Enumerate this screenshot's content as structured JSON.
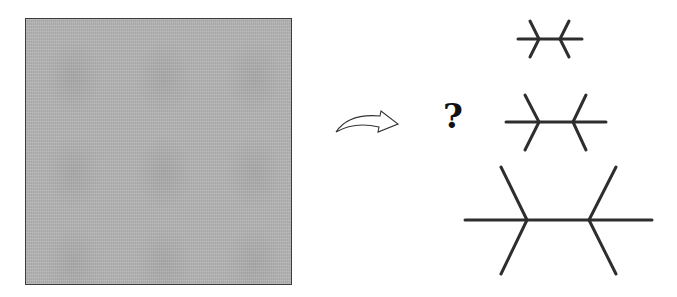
{
  "diagram": {
    "texture_square": {
      "label": "gray textured image",
      "fill_color": "#b4b4b4",
      "border_color": "#3c3c3c"
    },
    "arrow": {
      "label": "curved arrow pointing right",
      "stroke_color": "#333333"
    },
    "question": {
      "text": "?"
    },
    "figures": {
      "stroke_color": "#2e2e2e",
      "items": [
        {
          "name": "small",
          "label": "small double-fork figure"
        },
        {
          "name": "medium",
          "label": "medium double-fork figure"
        },
        {
          "name": "large",
          "label": "large double-fork figure"
        }
      ]
    }
  }
}
